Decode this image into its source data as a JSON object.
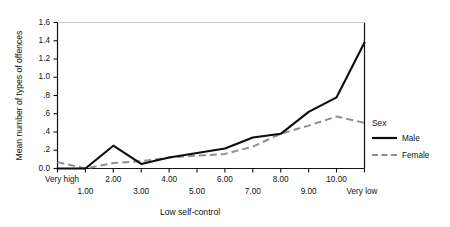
{
  "chart_data": {
    "type": "line",
    "title": "",
    "xlabel": "Low self-control",
    "ylabel": "Mean number of types of offences",
    "categories": [
      "Very high",
      "1.00",
      "2.00",
      "3.00",
      "4.00",
      "5.00",
      "6.00",
      "7.00",
      "8.00",
      "9.00",
      "10.00",
      "Very low"
    ],
    "xtick_labels_upper": [
      "Very high",
      "2.00",
      "4.00",
      "6.00",
      "8.00",
      "10.00"
    ],
    "xtick_labels_lower": [
      "1.00",
      "3.00",
      "5.00",
      "7.00",
      "9.00",
      "Very low"
    ],
    "ytick_labels": [
      "1.6",
      "1.4",
      "1.2",
      "1.0",
      ".8",
      ".6",
      ".4",
      ".2",
      "0.0"
    ],
    "ytick_values": [
      1.6,
      1.4,
      1.2,
      1.0,
      0.8,
      0.6,
      0.4,
      0.2,
      0.0
    ],
    "ylim": [
      0.0,
      1.6
    ],
    "grid": false,
    "legend_position": "right",
    "legend_title": "Sex",
    "series": [
      {
        "name": "Male",
        "style": "solid",
        "color": "#0d0d0d",
        "values": [
          0.0,
          0.0,
          0.25,
          0.05,
          0.12,
          0.17,
          0.22,
          0.34,
          0.38,
          0.62,
          0.78,
          1.38
        ]
      },
      {
        "name": "Female",
        "style": "dashed",
        "color": "#8f8f8f",
        "values": [
          0.07,
          0.0,
          0.06,
          0.08,
          0.12,
          0.14,
          0.16,
          0.24,
          0.38,
          0.47,
          0.57,
          0.5
        ]
      }
    ]
  },
  "legend": {
    "title": "Sex",
    "entries": [
      {
        "label": "Male",
        "color": "#0d0d0d",
        "style": "solid"
      },
      {
        "label": "Female",
        "color": "#8f8f8f",
        "style": "dashed"
      }
    ]
  },
  "axes": {
    "y_title": "Mean number of types of offences",
    "x_title": "Low self-control"
  }
}
